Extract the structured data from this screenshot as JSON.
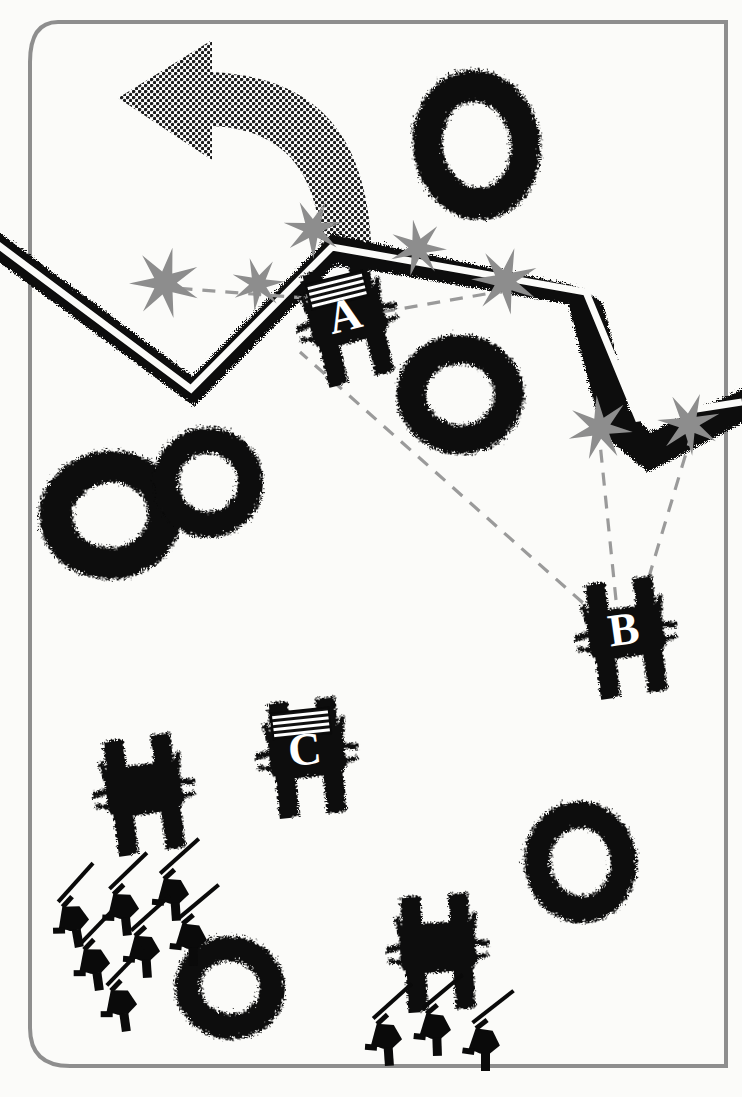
{
  "diagram": {
    "kind": "military-tactical-sketch",
    "canvas": {
      "width": 742,
      "height": 1097
    },
    "colors": {
      "background": "#fbfbf9",
      "ink": "#0a0a0a",
      "burst": "#8d8d8d",
      "arrow": "#2b2b2b",
      "frame": "#8e8e8e",
      "sight_line": "#9a9a9a",
      "label_text": "#ffffff"
    }
  },
  "frame": {
    "name": "page-border",
    "stroke": "#8e8e8e",
    "stroke_width": 4,
    "corner_radius_left": 42,
    "corner_radius_right": 0
  },
  "movement_arrow": {
    "name": "withdraw-arrow",
    "style": "halftone-dot-fill",
    "direction": "curving left / rearward",
    "fill": "#2b2b2b",
    "head_points": "left"
  },
  "trench": {
    "name": "enemy-trench-line",
    "description": "zigzag entrenchment with stippled parapet",
    "fill": "#0a0a0a",
    "segments": 6
  },
  "units": [
    {
      "id": "A",
      "label": "A",
      "type": "tank",
      "x": 345,
      "y": 318,
      "rotation": -14,
      "has_pennant": true,
      "labelled": true
    },
    {
      "id": "B",
      "label": "B",
      "type": "tank",
      "x": 624,
      "y": 632,
      "rotation": -8,
      "has_pennant": false,
      "labelled": true
    },
    {
      "id": "C",
      "label": "C",
      "type": "tank",
      "x": 305,
      "y": 752,
      "rotation": -6,
      "has_pennant": true,
      "labelled": true
    },
    {
      "id": "D",
      "label": "",
      "type": "tank",
      "x": 142,
      "y": 789,
      "rotation": -8,
      "has_pennant": false,
      "labelled": false
    },
    {
      "id": "E",
      "label": "",
      "type": "tank",
      "x": 436,
      "y": 947,
      "rotation": -4,
      "has_pennant": false,
      "labelled": false
    }
  ],
  "infantry_groups": [
    {
      "name": "infantry-squad-left",
      "count": 7,
      "posture": "prone firing",
      "members": [
        {
          "x": 72,
          "y": 920,
          "rotation": -22
        },
        {
          "x": 122,
          "y": 908,
          "rotation": -18
        },
        {
          "x": 172,
          "y": 893,
          "rotation": -16
        },
        {
          "x": 93,
          "y": 963,
          "rotation": -20
        },
        {
          "x": 143,
          "y": 950,
          "rotation": -16
        },
        {
          "x": 190,
          "y": 938,
          "rotation": -14
        },
        {
          "x": 120,
          "y": 1004,
          "rotation": -20
        }
      ]
    },
    {
      "name": "infantry-squad-right",
      "count": 3,
      "posture": "prone firing",
      "members": [
        {
          "x": 385,
          "y": 1038,
          "rotation": -16
        },
        {
          "x": 434,
          "y": 1028,
          "rotation": -14
        },
        {
          "x": 483,
          "y": 1043,
          "rotation": -12
        }
      ]
    }
  ],
  "shell_craters": [
    {
      "name": "crater-1",
      "cx": 474,
      "cy": 143,
      "rx": 60,
      "ry": 72,
      "rot": -8
    },
    {
      "name": "crater-2",
      "cx": 458,
      "cy": 392,
      "rx": 60,
      "ry": 56,
      "rot": 4
    },
    {
      "name": "crater-3",
      "cx": 108,
      "cy": 513,
      "rx": 67,
      "ry": 60,
      "rot": -4
    },
    {
      "name": "crater-4",
      "cx": 206,
      "cy": 480,
      "rx": 52,
      "ry": 52,
      "rot": 6
    },
    {
      "name": "crater-5",
      "cx": 578,
      "cy": 860,
      "rx": 53,
      "ry": 58,
      "rot": -6
    },
    {
      "name": "crater-6",
      "cx": 228,
      "cy": 985,
      "rx": 52,
      "ry": 48,
      "rot": 8
    }
  ],
  "impact_bursts": [
    {
      "name": "burst-1",
      "cx": 165,
      "cy": 283,
      "r": 36,
      "points": 7,
      "rot": 12
    },
    {
      "name": "burst-2",
      "cx": 258,
      "cy": 284,
      "r": 27,
      "points": 7,
      "rot": -18
    },
    {
      "name": "burst-3",
      "cx": 313,
      "cy": 229,
      "r": 30,
      "points": 7,
      "rot": 25
    },
    {
      "name": "burst-4",
      "cx": 418,
      "cy": 248,
      "r": 29,
      "points": 7,
      "rot": -10
    },
    {
      "name": "burst-5",
      "cx": 505,
      "cy": 281,
      "r": 34,
      "points": 7,
      "rot": 16
    },
    {
      "name": "burst-6",
      "cx": 600,
      "cy": 428,
      "r": 33,
      "points": 7,
      "rot": -6
    },
    {
      "name": "burst-7",
      "cx": 689,
      "cy": 424,
      "r": 32,
      "points": 7,
      "rot": 20
    }
  ],
  "fire_lines": [
    {
      "name": "fire-line-a-to-left-burst",
      "from": "A",
      "x1": 330,
      "y1": 300,
      "x2": 150,
      "y2": 286,
      "style": "dashed"
    },
    {
      "name": "fire-line-b-to-a-flank",
      "from": "B",
      "x1": 600,
      "y1": 618,
      "x2": 300,
      "y2": 352,
      "style": "dashed"
    },
    {
      "name": "fire-line-b-to-burst-6",
      "from": "B",
      "x1": 616,
      "y1": 600,
      "x2": 600,
      "y2": 443,
      "style": "dashed"
    },
    {
      "name": "fire-line-b-to-burst-7",
      "from": "B",
      "x1": 642,
      "y1": 600,
      "x2": 690,
      "y2": 440,
      "style": "dashed"
    },
    {
      "name": "fire-line-a-to-burst-5",
      "from": "A",
      "x1": 382,
      "y1": 312,
      "x2": 497,
      "y2": 292,
      "style": "dashed"
    }
  ],
  "legend": {
    "tank_symbol": "filled tank plan-view with hull, tracks and gun stubs",
    "pennant_symbol": "striped recognition panel on tank deck",
    "burst_symbol": "grey star = shell impact / hit",
    "crater_symbol": "stippled ring = shell crater",
    "trench_symbol": "black zigzag band = entrenchment",
    "arrow_symbol": "halftone curved arrow = direction of withdrawal"
  }
}
